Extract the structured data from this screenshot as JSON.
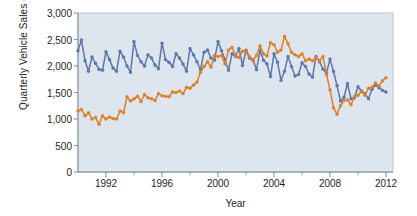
{
  "chart_data": {
    "type": "line",
    "title": "",
    "xlabel": "Year",
    "ylabel": "Quarterly Vehicle Sales (000)",
    "xlim": [
      1990.0,
      2012.5
    ],
    "ylim": [
      0,
      3000
    ],
    "grid": false,
    "legend": "none",
    "background_color": "#dde6ef",
    "yticks": [
      0,
      500,
      1000,
      1500,
      2000,
      2500,
      3000
    ],
    "ytick_labels": [
      "0",
      "500",
      "1,000",
      "1,500",
      "2,000",
      "2,500",
      "3,000"
    ],
    "xticks": [
      1992,
      1996,
      2000,
      2004,
      2008,
      2012
    ],
    "xtick_labels": [
      "1992",
      "1996",
      "2000",
      "2004",
      "2008",
      "2012"
    ],
    "xminor_ticks": [
      1994,
      1998,
      2002,
      2006,
      2010
    ],
    "x": [
      1990.0,
      1990.25,
      1990.5,
      1990.75,
      1991.0,
      1991.25,
      1991.5,
      1991.75,
      1992.0,
      1992.25,
      1992.5,
      1992.75,
      1993.0,
      1993.25,
      1993.5,
      1993.75,
      1994.0,
      1994.25,
      1994.5,
      1994.75,
      1995.0,
      1995.25,
      1995.5,
      1995.75,
      1996.0,
      1996.25,
      1996.5,
      1996.75,
      1997.0,
      1997.25,
      1997.5,
      1997.75,
      1998.0,
      1998.25,
      1998.5,
      1998.75,
      1999.0,
      1999.25,
      1999.5,
      1999.75,
      2000.0,
      2000.25,
      2000.5,
      2000.75,
      2001.0,
      2001.25,
      2001.5,
      2001.75,
      2002.0,
      2002.25,
      2002.5,
      2002.75,
      2003.0,
      2003.25,
      2003.5,
      2003.75,
      2004.0,
      2004.25,
      2004.5,
      2004.75,
      2005.0,
      2005.25,
      2005.5,
      2005.75,
      2006.0,
      2006.25,
      2006.5,
      2006.75,
      2007.0,
      2007.25,
      2007.5,
      2007.75,
      2008.0,
      2008.25,
      2008.5,
      2008.75,
      2009.0,
      2009.25,
      2009.5,
      2009.75,
      2010.0,
      2010.25,
      2010.5,
      2010.75,
      2011.0,
      2011.25,
      2011.5,
      2011.75,
      2012.0
    ],
    "series": [
      {
        "name": "blue-series",
        "color": "#5b77a8",
        "marker": "circle",
        "values": [
          2290,
          2490,
          2100,
          1900,
          2170,
          2050,
          1940,
          1920,
          2270,
          2120,
          1960,
          1900,
          2280,
          2170,
          2000,
          1880,
          2460,
          2200,
          2080,
          2000,
          2210,
          2150,
          2020,
          1950,
          2430,
          2120,
          2070,
          1990,
          2230,
          2150,
          2040,
          1900,
          2330,
          2210,
          2080,
          1930,
          2260,
          2300,
          2150,
          2110,
          2460,
          2290,
          2120,
          1920,
          2230,
          2180,
          2330,
          2010,
          2290,
          2150,
          2120,
          1930,
          2290,
          2110,
          2040,
          1800,
          2230,
          2070,
          1730,
          1900,
          2180,
          1990,
          1810,
          1840,
          2060,
          1990,
          1850,
          1790,
          2180,
          2080,
          1940,
          1870,
          2130,
          1900,
          1630,
          1340,
          1410,
          1670,
          1380,
          1400,
          1610,
          1530,
          1480,
          1380,
          1560,
          1640,
          1590,
          1540,
          1510
        ]
      },
      {
        "name": "orange-series",
        "color": "#dd7e2a",
        "marker": "circle",
        "values": [
          1150,
          1180,
          1060,
          1120,
          1000,
          1030,
          900,
          1060,
          1000,
          1040,
          1010,
          1000,
          1150,
          1120,
          1420,
          1340,
          1380,
          1430,
          1330,
          1460,
          1400,
          1380,
          1350,
          1480,
          1440,
          1430,
          1420,
          1510,
          1500,
          1530,
          1480,
          1600,
          1580,
          1640,
          1700,
          1880,
          1990,
          2080,
          1980,
          2200,
          2180,
          2200,
          2040,
          2300,
          2350,
          2200,
          2160,
          2280,
          2300,
          2180,
          2100,
          2200,
          2380,
          2230,
          2190,
          2440,
          2400,
          2260,
          2300,
          2560,
          2420,
          2260,
          2210,
          2180,
          2230,
          2100,
          2130,
          2100,
          2160,
          2100,
          2180,
          1840,
          1550,
          1210,
          1090,
          1250,
          1350,
          1360,
          1270,
          1420,
          1450,
          1520,
          1450,
          1580,
          1600,
          1680,
          1620,
          1720,
          1780
        ]
      }
    ]
  }
}
